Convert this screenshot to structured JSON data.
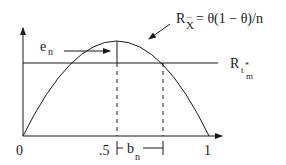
{
  "diagram": {
    "type": "risk-function-plot",
    "curve_label": {
      "R": "R",
      "subscript": "X",
      "subscript_bar": "¯",
      "formula": "= θ(1 − θ)/n"
    },
    "hline_label": {
      "R": "R",
      "sub": "t",
      "sup": "*",
      "subsub": "m"
    },
    "e_label": {
      "main": "e",
      "sub": "n"
    },
    "b_label": {
      "main": "b",
      "sub": "n"
    },
    "x_ticks": [
      "0",
      ".5",
      "1"
    ],
    "colors": {
      "ink": "#1a1a1a",
      "background": "#ffffff"
    }
  }
}
